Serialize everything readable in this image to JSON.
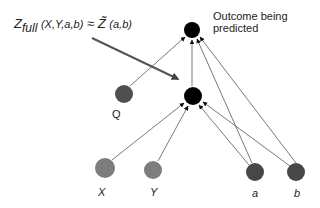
{
  "diagram": {
    "annotation": {
      "z_main": "Z",
      "z_sub": "full",
      "z_args": "(X,Y,a,b)",
      "approx": "≈",
      "z_tilde": "Z̃",
      "z_tilde_args": "(a,b)"
    },
    "outcome_label_line1": "Outcome being",
    "outcome_label_line2": "predicted",
    "nodes": [
      {
        "id": "outcome",
        "label": "",
        "color": "#000000"
      },
      {
        "id": "mediator",
        "label": "",
        "color": "#000000"
      },
      {
        "id": "Q",
        "label": "Q",
        "color": "#555555"
      },
      {
        "id": "X",
        "label": "X",
        "color": "#808080"
      },
      {
        "id": "Y",
        "label": "Y",
        "color": "#808080"
      },
      {
        "id": "a",
        "label": "a",
        "color": "#4a4a4a"
      },
      {
        "id": "b",
        "label": "b",
        "color": "#4a4a4a"
      }
    ],
    "edges": [
      [
        "Q",
        "outcome"
      ],
      [
        "mediator",
        "outcome"
      ],
      [
        "a",
        "outcome"
      ],
      [
        "b",
        "outcome"
      ],
      [
        "X",
        "mediator"
      ],
      [
        "Y",
        "mediator"
      ],
      [
        "a",
        "mediator"
      ],
      [
        "b",
        "mediator"
      ]
    ]
  }
}
